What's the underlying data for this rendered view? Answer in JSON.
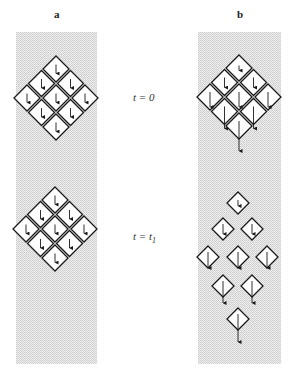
{
  "panels": [
    {
      "id": "a",
      "label": "a"
    },
    {
      "id": "b",
      "label": "b"
    }
  ],
  "time_labels": {
    "t0": {
      "var": "t",
      "eq": " = ",
      "value": "0"
    },
    "t1": {
      "var": "t",
      "eq": " = ",
      "value": "t",
      "sub": "1"
    }
  },
  "colors": {
    "background": "#ffffff",
    "panel_fill": "#e4e4e4",
    "stroke": "#1a1a1a",
    "diamond_fill": "#ffffff"
  },
  "diagram": {
    "panel_a_t0": {
      "center": [
        56,
        98
      ],
      "spacing": 14.5,
      "half": 13,
      "arrow_lengths": [
        9,
        9,
        9,
        9,
        9,
        9,
        9,
        9,
        9
      ]
    },
    "panel_a_t1": {
      "center": [
        55,
        229
      ],
      "spacing": 14.5,
      "half": 13,
      "arrow_lengths": [
        9,
        9,
        9,
        9,
        9,
        9,
        9,
        9,
        9
      ]
    },
    "panel_b_t0": {
      "center": [
        239,
        97
      ],
      "spacing": 14.5,
      "half": 13,
      "arrow_lengths_by_row": [
        5,
        10,
        15,
        22,
        30
      ]
    },
    "panel_b_t1": {
      "cells": [
        {
          "x": 238,
          "y": 203,
          "len": 6
        },
        {
          "x": 223,
          "y": 229,
          "len": 10
        },
        {
          "x": 252,
          "y": 229,
          "len": 10
        },
        {
          "x": 208,
          "y": 257,
          "len": 16
        },
        {
          "x": 238,
          "y": 257,
          "len": 16
        },
        {
          "x": 267,
          "y": 257,
          "len": 16
        },
        {
          "x": 223,
          "y": 286,
          "len": 22
        },
        {
          "x": 252,
          "y": 286,
          "len": 22
        },
        {
          "x": 238,
          "y": 319,
          "len": 28
        }
      ],
      "half": 11
    }
  }
}
